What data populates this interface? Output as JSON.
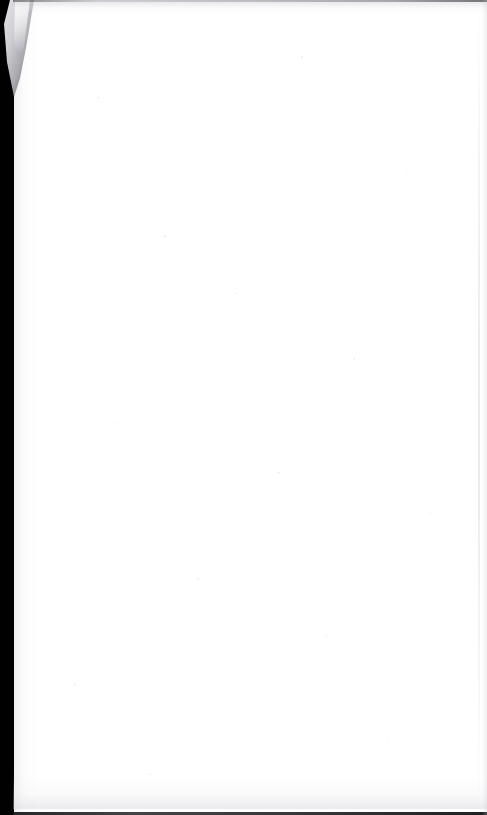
{
  "document": {
    "page_content_text": "",
    "page_is_blank": true,
    "visible_text_lines": []
  },
  "scan": {
    "page_background_color": "#ffffff",
    "scanner_backing_color": "#010101",
    "top_shadow_color": "#bcbcc2",
    "bottom_shadow_color": "#cecdd4",
    "curl_highlight_color": "#e9e9ec",
    "curl_midtone_color": "#a9a9b0",
    "seam_color": "#c8c8ce"
  }
}
